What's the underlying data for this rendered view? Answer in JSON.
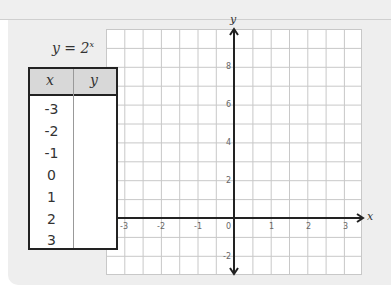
{
  "equation": {
    "base": "y = 2",
    "exponent": "x"
  },
  "table": {
    "headers": [
      "x",
      "y"
    ],
    "rows": [
      {
        "x": "-3",
        "y": ""
      },
      {
        "x": "-2",
        "y": ""
      },
      {
        "x": "-1",
        "y": ""
      },
      {
        "x": "0",
        "y": ""
      },
      {
        "x": "1",
        "y": ""
      },
      {
        "x": "2",
        "y": ""
      },
      {
        "x": "3",
        "y": ""
      }
    ]
  },
  "graph": {
    "x_axis_label": "x",
    "y_axis_label": "y",
    "x_ticks": [
      "-3",
      "-2",
      "-1",
      "0",
      "1",
      "2",
      "3"
    ],
    "y_ticks": [
      "8",
      "6",
      "4",
      "2",
      "-2"
    ],
    "x_range": [
      -3.5,
      3.5
    ],
    "y_range": [
      -3,
      10
    ],
    "x_grid_step": 0.5,
    "y_grid_step": 1
  }
}
